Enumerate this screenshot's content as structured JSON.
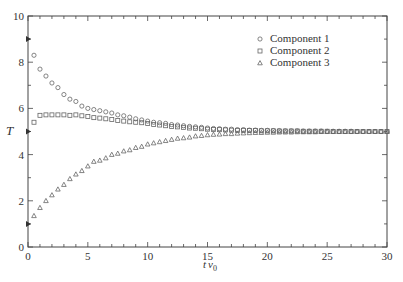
{
  "chart_data": {
    "type": "scatter",
    "title": "",
    "xlabel": "tν₀",
    "ylabel": "T",
    "xlim": [
      0,
      30
    ],
    "ylim": [
      0,
      10
    ],
    "xticks": [
      0,
      5,
      10,
      15,
      20,
      25,
      30
    ],
    "yticks": [
      0,
      2,
      4,
      6,
      8,
      10
    ],
    "x_minor_step": 1,
    "y_minor_step": 1,
    "grid": false,
    "legend_position": "upper right",
    "initial_values": [
      9,
      5,
      1
    ],
    "series": [
      {
        "name": "Component 1",
        "marker": "circle",
        "x": [
          0.5,
          1,
          1.5,
          2,
          2.5,
          3,
          3.5,
          4,
          4.5,
          5,
          5.5,
          6,
          6.5,
          7,
          7.5,
          8,
          8.5,
          9,
          9.5,
          10,
          10.5,
          11,
          11.5,
          12,
          12.5,
          13,
          13.5,
          14,
          14.5,
          15,
          15.5,
          16,
          16.5,
          17,
          17.5,
          18,
          18.5,
          19,
          19.5,
          20,
          20.5,
          21,
          21.5,
          22,
          22.5,
          23,
          23.5,
          24,
          24.5,
          25,
          25.5,
          26,
          26.5,
          27,
          27.5,
          28,
          28.5,
          29,
          29.5,
          30
        ],
        "values": [
          8.3,
          7.7,
          7.4,
          7.1,
          6.9,
          6.6,
          6.4,
          6.3,
          6.1,
          6.0,
          5.95,
          5.9,
          5.85,
          5.8,
          5.72,
          5.68,
          5.62,
          5.55,
          5.5,
          5.45,
          5.4,
          5.38,
          5.35,
          5.3,
          5.28,
          5.25,
          5.22,
          5.2,
          5.18,
          5.15,
          5.13,
          5.12,
          5.1,
          5.1,
          5.08,
          5.08,
          5.06,
          5.06,
          5.05,
          5.05,
          5.04,
          5.04,
          5.03,
          5.03,
          5.03,
          5.02,
          5.02,
          5.02,
          5.02,
          5.01,
          5.01,
          5.01,
          5.01,
          5.01,
          5.0,
          5.0,
          5.0,
          5.0,
          5.0,
          5.0
        ]
      },
      {
        "name": "Component 2",
        "marker": "square",
        "x": [
          0.5,
          1,
          1.5,
          2,
          2.5,
          3,
          3.5,
          4,
          4.5,
          5,
          5.5,
          6,
          6.5,
          7,
          7.5,
          8,
          8.5,
          9,
          9.5,
          10,
          10.5,
          11,
          11.5,
          12,
          12.5,
          13,
          13.5,
          14,
          14.5,
          15,
          15.5,
          16,
          16.5,
          17,
          17.5,
          18,
          18.5,
          19,
          19.5,
          20,
          20.5,
          21,
          21.5,
          22,
          22.5,
          23,
          23.5,
          24,
          24.5,
          25,
          25.5,
          26,
          26.5,
          27,
          27.5,
          28,
          28.5,
          29,
          29.5,
          30
        ],
        "values": [
          5.4,
          5.7,
          5.72,
          5.72,
          5.72,
          5.72,
          5.7,
          5.72,
          5.68,
          5.65,
          5.6,
          5.58,
          5.55,
          5.52,
          5.48,
          5.45,
          5.42,
          5.4,
          5.38,
          5.35,
          5.3,
          5.28,
          5.25,
          5.22,
          5.2,
          5.18,
          5.15,
          5.14,
          5.12,
          5.1,
          5.09,
          5.08,
          5.07,
          5.06,
          5.05,
          5.05,
          5.04,
          5.04,
          5.03,
          5.03,
          5.03,
          5.02,
          5.02,
          5.02,
          5.02,
          5.01,
          5.01,
          5.01,
          5.01,
          5.01,
          5.0,
          5.0,
          5.0,
          5.0,
          5.0,
          5.0,
          5.0,
          5.0,
          5.0,
          5.0
        ]
      },
      {
        "name": "Component 3",
        "marker": "triangle",
        "x": [
          0.5,
          1,
          1.5,
          2,
          2.5,
          3,
          3.5,
          4,
          4.5,
          5,
          5.5,
          6,
          6.5,
          7,
          7.5,
          8,
          8.5,
          9,
          9.5,
          10,
          10.5,
          11,
          11.5,
          12,
          12.5,
          13,
          13.5,
          14,
          14.5,
          15,
          15.5,
          16,
          16.5,
          17,
          17.5,
          18,
          18.5,
          19,
          19.5,
          20,
          20.5,
          21,
          21.5,
          22,
          22.5,
          23,
          23.5,
          24,
          24.5,
          25,
          25.5,
          26,
          26.5,
          27,
          27.5,
          28,
          28.5,
          29,
          29.5,
          30
        ],
        "values": [
          1.35,
          1.7,
          2.0,
          2.25,
          2.5,
          2.7,
          2.95,
          3.15,
          3.3,
          3.5,
          3.7,
          3.75,
          3.85,
          4.0,
          4.05,
          4.15,
          4.2,
          4.3,
          4.35,
          4.45,
          4.5,
          4.55,
          4.6,
          4.65,
          4.7,
          4.72,
          4.75,
          4.8,
          4.82,
          4.85,
          4.87,
          4.88,
          4.9,
          4.9,
          4.92,
          4.93,
          4.94,
          4.95,
          4.95,
          4.96,
          4.96,
          4.97,
          4.97,
          4.97,
          4.98,
          4.98,
          4.98,
          4.98,
          4.99,
          4.99,
          4.99,
          4.99,
          4.99,
          4.99,
          5.0,
          5.0,
          5.0,
          5.0,
          5.0,
          5.0
        ]
      }
    ]
  },
  "labels": {
    "xlabel_main": "t",
    "xlabel_nu": "ν",
    "xlabel_sub": "0",
    "ylabel": "T",
    "legend": [
      "Component 1",
      "Component 2",
      "Component 3"
    ]
  }
}
